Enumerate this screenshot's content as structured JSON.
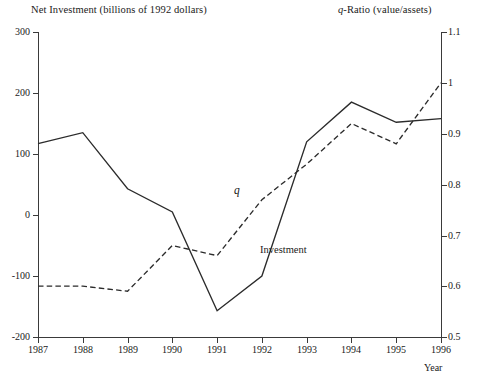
{
  "titles": {
    "left_axis_title": "Net Investment (billions of 1992 dollars)",
    "right_axis_title_italic": "q",
    "right_axis_title_rest": "-Ratio (value/assets)",
    "x_axis_title": "Year"
  },
  "annotations": {
    "q_series_label": "q",
    "investment_series_label": "Investment"
  },
  "axes": {
    "left_ticks": [
      "300",
      "200",
      "100",
      "0",
      "-100",
      "-200"
    ],
    "right_ticks": [
      "1.1",
      "1",
      "0.9",
      "0.8",
      "0.7",
      "0.6",
      "0.5"
    ],
    "x_ticks": [
      "1987",
      "1988",
      "1989",
      "1990",
      "1991",
      "1992",
      "1993",
      "1994",
      "1995",
      "1996"
    ]
  },
  "chart_data": {
    "type": "line",
    "title": "",
    "xlabel": "Year",
    "ylabel": "Net Investment (billions of 1992 dollars)",
    "y2label": "q-Ratio (value/assets)",
    "x": [
      1987,
      1988,
      1989,
      1990,
      1991,
      1992,
      1993,
      1994,
      1995,
      1996
    ],
    "xlim": [
      1987,
      1996
    ],
    "ylim": [
      -200,
      300
    ],
    "y2lim": [
      0.5,
      1.1
    ],
    "grid": false,
    "legend": "inline-annotations",
    "series": [
      {
        "name": "Investment",
        "axis": "left",
        "style": "solid",
        "color": "#2b2b2b",
        "values": [
          117,
          135,
          43,
          5,
          -157,
          -100,
          120,
          185,
          152,
          158
        ]
      },
      {
        "name": "q",
        "axis": "right",
        "style": "dashed",
        "color": "#2b2b2b",
        "values": [
          0.6,
          0.6,
          0.59,
          0.68,
          0.66,
          0.77,
          0.84,
          0.92,
          0.88,
          1.0
        ]
      }
    ]
  },
  "colors": {
    "line": "#2b2b2b",
    "axis": "#3a3a3a",
    "background": "#ffffff",
    "text": "#1a1a1a"
  }
}
